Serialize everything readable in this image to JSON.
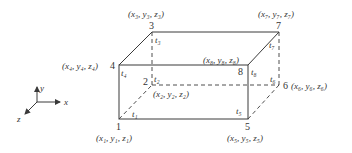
{
  "figure": {
    "type": "hexahedral element (brick) with 8 nodes",
    "axes": {
      "x": "x",
      "y": "y",
      "z": "z"
    },
    "nodes": [
      {
        "id": "1",
        "coord": "(x₁, y₁, z₁)",
        "t": "t₁"
      },
      {
        "id": "2",
        "coord": "(x₂, y₂, z₂)",
        "t": "t₂"
      },
      {
        "id": "3",
        "coord": "(x₃, y₃, z₃)",
        "t": "t₃"
      },
      {
        "id": "4",
        "coord": "(x₄, y₄, z₄)",
        "t": "t₄"
      },
      {
        "id": "5",
        "coord": "(x₅, y₅, z₅)",
        "t": "t₅"
      },
      {
        "id": "6",
        "coord": "(x₆, y₆, z₆)",
        "t": "t₆"
      },
      {
        "id": "7",
        "coord": "(x₇, y₇, z₇)",
        "t": "t₇"
      },
      {
        "id": "8",
        "coord": "(x₈, y₈, z₈)",
        "t": "t₈"
      }
    ],
    "colors": {
      "line": "#3a3a3a",
      "text": "#333333",
      "background": "#ffffff"
    }
  }
}
